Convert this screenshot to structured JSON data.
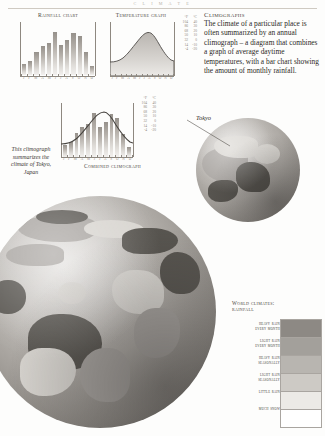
{
  "running_head": "C L I M A T E",
  "panels": {
    "rainfall": {
      "title": "Rainfall chart",
      "months": [
        "J",
        "F",
        "M",
        "A",
        "M",
        "J",
        "J",
        "A",
        "S",
        "O",
        "N",
        "D"
      ]
    },
    "temperature": {
      "title": "Temperature graph",
      "unit_f": "°F",
      "unit_c": "°C",
      "scale_f": [
        "104",
        "86",
        "68",
        "50",
        "32",
        "14",
        "-4"
      ],
      "scale_c": [
        "40",
        "30",
        "20",
        "10",
        "0",
        "-10",
        "-20"
      ],
      "months": [
        "J",
        "F",
        "M",
        "A",
        "M",
        "J",
        "J",
        "A",
        "S",
        "O",
        "N",
        "D"
      ]
    },
    "combined": {
      "title": "Combined climograph",
      "unit_f": "°F",
      "unit_c": "°C",
      "scale_f": [
        "104",
        "86",
        "68",
        "50",
        "32",
        "14",
        "-4"
      ],
      "scale_c": [
        "40",
        "30",
        "20",
        "10",
        "0",
        "-10",
        "-20"
      ],
      "months": [
        "J",
        "F",
        "M",
        "A",
        "M",
        "J",
        "J",
        "A",
        "S",
        "O",
        "N",
        "D"
      ]
    }
  },
  "captions": {
    "left_italic": "This climograph summarizes the climate of Tokyo, Japan",
    "tokyo": "Tokyo"
  },
  "intro": {
    "heading": "Climographs",
    "body": "The climate of a particular place is often summarized by an annual climograph – a diagram that combines a graph of average daytime temperatures, with a bar chart showing the amount of monthly rainfall."
  },
  "legend": {
    "title_line1": "World climates:",
    "title_line2": "rainfall",
    "items": [
      {
        "label_line1": "heavy rain",
        "label_line2": "every month",
        "color": "#8d8984"
      },
      {
        "label_line1": "light rain",
        "label_line2": "every month",
        "color": "#a3a09b"
      },
      {
        "label_line1": "heavy rain",
        "label_line2": "seasonally",
        "color": "#b8b5b0"
      },
      {
        "label_line1": "light rain",
        "label_line2": "seasonally",
        "color": "#cdcac5"
      },
      {
        "label_line1": "little rain",
        "label_line2": "",
        "color": "#eceae6"
      },
      {
        "label_line1": "much snow",
        "label_line2": "",
        "color": "#ffffff"
      }
    ]
  },
  "chart_data": [
    {
      "type": "bar",
      "title": "Rainfall chart",
      "xlabel": "",
      "ylabel": "rainfall (mm)",
      "categories": [
        "J",
        "F",
        "M",
        "A",
        "M",
        "J",
        "J",
        "A",
        "S",
        "O",
        "N",
        "D"
      ],
      "values": [
        48,
        60,
        100,
        125,
        138,
        185,
        126,
        148,
        180,
        164,
        96,
        40
      ],
      "ylim": [
        0,
        200
      ],
      "grid": false,
      "legend": "none"
    },
    {
      "type": "area",
      "title": "Temperature graph",
      "xlabel": "",
      "ylabel": "temperature",
      "categories": [
        "J",
        "F",
        "M",
        "A",
        "M",
        "J",
        "J",
        "A",
        "S",
        "O",
        "N",
        "D"
      ],
      "series": [
        {
          "name": "average daytime temperature (°C)",
          "values": [
            10,
            10,
            13,
            18,
            22,
            25,
            29,
            31,
            27,
            21,
            17,
            12
          ]
        }
      ],
      "y_axis_left": {
        "label": "°F",
        "ticks": [
          "-4",
          "14",
          "32",
          "50",
          "68",
          "86",
          "104"
        ]
      },
      "y_axis_right": {
        "label": "°C",
        "ticks": [
          "-20",
          "-10",
          "0",
          "10",
          "20",
          "30",
          "40"
        ]
      },
      "ylim": [
        -20,
        40
      ],
      "grid": false,
      "legend": "none"
    },
    {
      "type": "bar",
      "title": "Combined climograph",
      "xlabel": "",
      "ylabel": "rainfall and temperature",
      "categories": [
        "J",
        "F",
        "M",
        "A",
        "M",
        "J",
        "J",
        "A",
        "S",
        "O",
        "N",
        "D"
      ],
      "values": [
        48,
        60,
        100,
        125,
        138,
        185,
        126,
        148,
        180,
        164,
        96,
        40
      ],
      "series": [
        {
          "name": "average daytime temperature (°C)",
          "values": [
            10,
            10,
            13,
            18,
            22,
            25,
            29,
            31,
            27,
            21,
            17,
            12
          ]
        }
      ],
      "y_axis_left": {
        "label": "°F",
        "ticks": [
          "-4",
          "14",
          "32",
          "50",
          "68",
          "86",
          "104"
        ]
      },
      "y_axis_right": {
        "label": "°C",
        "ticks": [
          "-20",
          "-10",
          "0",
          "10",
          "20",
          "30",
          "40"
        ]
      },
      "ylim": [
        -20,
        40
      ],
      "grid": false,
      "legend": "none"
    }
  ]
}
